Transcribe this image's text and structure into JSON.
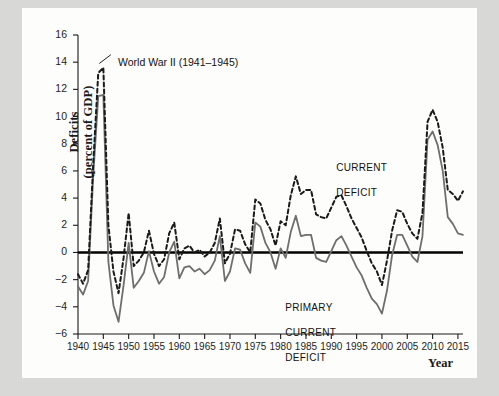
{
  "figure": {
    "background_outer": "#d8d8d6",
    "background_card": "#fdfdfc"
  },
  "chart_data": {
    "type": "line",
    "title": "",
    "xlabel": "Year",
    "ylabel": "Deficits\n(percent of GDP)",
    "ylabel_line1": "Deficits",
    "ylabel_line2": "(percent of GDP)",
    "xlim": [
      1940,
      2016
    ],
    "ylim": [
      -6,
      16
    ],
    "grid": false,
    "zero_line": true,
    "legend_position": "inline-annotations",
    "ytick_labels": [
      "16",
      "14",
      "12",
      "10",
      "8",
      "6",
      "4",
      "2",
      "0",
      "-2",
      "-4",
      "-6"
    ],
    "ytick_values": [
      16,
      14,
      12,
      10,
      8,
      6,
      4,
      2,
      0,
      -2,
      -4,
      -6
    ],
    "xtick_labels": [
      "1940",
      "1945",
      "1950",
      "1955",
      "1960",
      "1965",
      "1970",
      "1975",
      "1980",
      "1985",
      "1990",
      "1995",
      "2000",
      "2005",
      "2010",
      "2015"
    ],
    "xtick_values": [
      1940,
      1945,
      1950,
      1955,
      1960,
      1965,
      1970,
      1975,
      1980,
      1985,
      1990,
      1995,
      2000,
      2005,
      2010,
      2015
    ],
    "annotations": [
      {
        "text": "World War II (1941–1945)",
        "x": 1944,
        "y": 13.6,
        "name": "wwii-annotation"
      },
      {
        "text": "CURRENT\nDEFICIT",
        "line1": "CURRENT",
        "line2": "DEFICIT",
        "x": 1991,
        "y": 6.6,
        "name": "current-deficit-label"
      },
      {
        "text": "PRIMARY\nCURRENT\nDEFICIT",
        "line1": "PRIMARY",
        "line2": "CURRENT",
        "line3": "DEFICIT",
        "x": 1983,
        "y": -3.0,
        "name": "primary-current-deficit-label"
      }
    ],
    "x": [
      1940,
      1941,
      1942,
      1943,
      1944,
      1945,
      1946,
      1947,
      1948,
      1949,
      1950,
      1951,
      1952,
      1953,
      1954,
      1955,
      1956,
      1957,
      1958,
      1959,
      1960,
      1961,
      1962,
      1963,
      1964,
      1965,
      1966,
      1967,
      1968,
      1969,
      1970,
      1971,
      1972,
      1973,
      1974,
      1975,
      1976,
      1977,
      1978,
      1979,
      1980,
      1981,
      1982,
      1983,
      1984,
      1985,
      1986,
      1987,
      1988,
      1989,
      1990,
      1991,
      1992,
      1993,
      1994,
      1995,
      1996,
      1997,
      1998,
      1999,
      2000,
      2001,
      2002,
      2003,
      2004,
      2005,
      2006,
      2007,
      2008,
      2009,
      2010,
      2011,
      2012,
      2013,
      2014,
      2015,
      2016
    ],
    "series": [
      {
        "name": "CURRENT DEFICIT",
        "style": "dashed",
        "color": "#1a1a1a",
        "width": 2.0,
        "values": [
          -1.6,
          -2.3,
          -1.3,
          6.5,
          13.2,
          13.6,
          2.0,
          -1.4,
          -3.0,
          -0.4,
          2.9,
          -1.0,
          -0.6,
          0.0,
          1.6,
          -0.1,
          -1.0,
          -0.5,
          1.4,
          2.2,
          -0.5,
          0.3,
          0.5,
          0.0,
          0.2,
          -0.3,
          0.0,
          0.7,
          2.5,
          -0.8,
          -0.1,
          1.7,
          1.6,
          0.6,
          0.0,
          3.9,
          3.6,
          2.4,
          1.7,
          0.5,
          2.3,
          2.0,
          4.2,
          5.6,
          4.3,
          4.6,
          4.6,
          2.8,
          2.6,
          2.5,
          3.3,
          4.1,
          4.2,
          3.4,
          2.5,
          1.8,
          1.1,
          0.1,
          -0.8,
          -1.4,
          -2.4,
          -0.6,
          1.6,
          3.1,
          3.0,
          2.1,
          1.4,
          1.0,
          2.9,
          9.6,
          10.5,
          9.6,
          7.7,
          4.6,
          4.3,
          3.8,
          4.5
        ]
      },
      {
        "name": "PRIMARY CURRENT DEFICIT",
        "style": "solid",
        "color": "#6e6e6e",
        "width": 1.8,
        "values": [
          -2.5,
          -3.1,
          -2.1,
          5.6,
          11.5,
          11.6,
          -0.7,
          -3.9,
          -5.1,
          -2.4,
          0.7,
          -2.6,
          -2.1,
          -1.5,
          0.1,
          -1.4,
          -2.3,
          -1.8,
          0.0,
          0.8,
          -1.9,
          -1.1,
          -1.0,
          -1.4,
          -1.2,
          -1.6,
          -1.3,
          -0.6,
          1.2,
          -2.1,
          -1.4,
          0.3,
          0.2,
          -0.8,
          -1.5,
          2.2,
          1.9,
          0.7,
          0.0,
          -1.2,
          0.3,
          -0.4,
          1.5,
          2.7,
          1.2,
          1.3,
          1.3,
          -0.4,
          -0.6,
          -0.7,
          0.1,
          0.9,
          1.2,
          0.5,
          -0.3,
          -1.1,
          -1.7,
          -2.6,
          -3.4,
          -3.8,
          -4.5,
          -2.8,
          -0.2,
          1.3,
          1.3,
          0.5,
          -0.3,
          -0.7,
          1.2,
          8.3,
          8.9,
          7.9,
          6.0,
          2.6,
          2.1,
          1.4,
          1.3
        ]
      }
    ]
  }
}
